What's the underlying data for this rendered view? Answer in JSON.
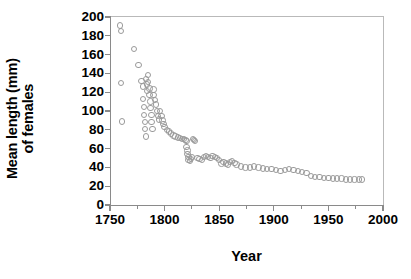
{
  "chart_data": {
    "type": "scatter",
    "title": "",
    "xlabel": "Year",
    "ylabel": "Mean length (mm) of females",
    "ylabel_lines": [
      "Mean length (mm)",
      "of females"
    ],
    "xlim": [
      1750,
      2000
    ],
    "ylim": [
      0,
      200
    ],
    "xticks": [
      1750,
      1800,
      1850,
      1900,
      1950,
      2000
    ],
    "xticklabels": [
      "1750",
      "1800",
      "1850",
      "1900",
      "1950",
      "2000"
    ],
    "xminorticks": [
      1775,
      1825,
      1875,
      1925,
      1975
    ],
    "yticks": [
      0,
      20,
      40,
      60,
      80,
      100,
      120,
      140,
      160,
      180,
      200
    ],
    "yticklabels": [
      "0",
      "20",
      "40",
      "60",
      "80",
      "100",
      "120",
      "140",
      "160",
      "180",
      "200"
    ],
    "grid": false,
    "legend": null,
    "marker": "open-circle",
    "marker_facecolor": "#ffffff",
    "marker_edgecolor": "#9a9a9a",
    "axis_color": "#8a8a8a",
    "text_color": "#000000",
    "background": "#ffffff",
    "series": [
      {
        "name": "Mean length of females",
        "points": [
          [
            1759,
            191
          ],
          [
            1760,
            185
          ],
          [
            1760,
            130
          ],
          [
            1761,
            89
          ],
          [
            1772,
            166
          ],
          [
            1776,
            149
          ],
          [
            1779,
            132
          ],
          [
            1780,
            126
          ],
          [
            1780,
            113
          ],
          [
            1781,
            104
          ],
          [
            1781,
            96
          ],
          [
            1782,
            88
          ],
          [
            1782,
            81
          ],
          [
            1783,
            73
          ],
          [
            1783,
            134
          ],
          [
            1784,
            128
          ],
          [
            1784,
            121
          ],
          [
            1785,
            138
          ],
          [
            1785,
            131
          ],
          [
            1786,
            124
          ],
          [
            1786,
            117
          ],
          [
            1787,
            110
          ],
          [
            1787,
            103
          ],
          [
            1788,
            96
          ],
          [
            1788,
            88
          ],
          [
            1789,
            81
          ],
          [
            1790,
            123
          ],
          [
            1790,
            117
          ],
          [
            1791,
            112
          ],
          [
            1792,
            107
          ],
          [
            1793,
            100
          ],
          [
            1794,
            95
          ],
          [
            1795,
            91
          ],
          [
            1796,
            100
          ],
          [
            1797,
            95
          ],
          [
            1798,
            90
          ],
          [
            1799,
            86
          ],
          [
            1800,
            83
          ],
          [
            1802,
            80
          ],
          [
            1804,
            78
          ],
          [
            1806,
            76
          ],
          [
            1808,
            74
          ],
          [
            1810,
            73
          ],
          [
            1812,
            72
          ],
          [
            1814,
            71
          ],
          [
            1816,
            70
          ],
          [
            1818,
            70
          ],
          [
            1819,
            69
          ],
          [
            1820,
            68
          ],
          [
            1820,
            62
          ],
          [
            1821,
            58
          ],
          [
            1821,
            54
          ],
          [
            1822,
            51
          ],
          [
            1822,
            48
          ],
          [
            1823,
            47
          ],
          [
            1824,
            49
          ],
          [
            1825,
            51
          ],
          [
            1826,
            70
          ],
          [
            1827,
            69
          ],
          [
            1828,
            68
          ],
          [
            1830,
            50
          ],
          [
            1832,
            49
          ],
          [
            1834,
            48
          ],
          [
            1836,
            51
          ],
          [
            1838,
            52
          ],
          [
            1840,
            51
          ],
          [
            1842,
            50
          ],
          [
            1844,
            52
          ],
          [
            1846,
            51
          ],
          [
            1848,
            50
          ],
          [
            1850,
            48
          ],
          [
            1852,
            44
          ],
          [
            1854,
            46
          ],
          [
            1856,
            44
          ],
          [
            1858,
            43
          ],
          [
            1860,
            46
          ],
          [
            1862,
            47
          ],
          [
            1864,
            45
          ],
          [
            1866,
            43
          ],
          [
            1870,
            41
          ],
          [
            1874,
            40
          ],
          [
            1878,
            40
          ],
          [
            1882,
            41
          ],
          [
            1886,
            40
          ],
          [
            1890,
            39
          ],
          [
            1894,
            38
          ],
          [
            1898,
            38
          ],
          [
            1902,
            37
          ],
          [
            1906,
            36
          ],
          [
            1910,
            37
          ],
          [
            1914,
            38
          ],
          [
            1918,
            37
          ],
          [
            1922,
            36
          ],
          [
            1926,
            35
          ],
          [
            1930,
            34
          ],
          [
            1934,
            31
          ],
          [
            1938,
            30
          ],
          [
            1942,
            30
          ],
          [
            1946,
            29
          ],
          [
            1950,
            29
          ],
          [
            1954,
            28
          ],
          [
            1958,
            28
          ],
          [
            1962,
            28
          ],
          [
            1966,
            27
          ],
          [
            1970,
            27
          ],
          [
            1974,
            27
          ],
          [
            1978,
            27
          ],
          [
            1981,
            27
          ]
        ]
      }
    ]
  }
}
